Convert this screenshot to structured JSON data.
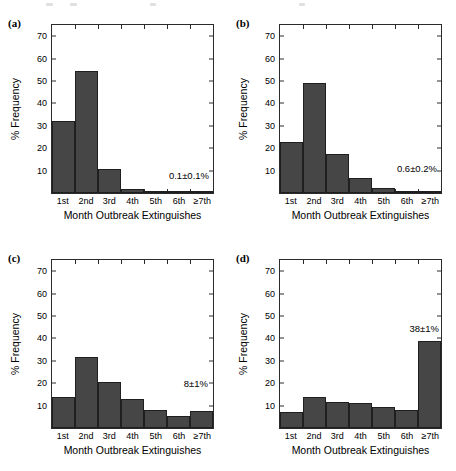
{
  "figure": {
    "panels": [
      {
        "key": "a",
        "label": "(a)",
        "week_note": "Week=1",
        "series_note": "0.1±0.1%",
        "note_position": "inside-bottom-right",
        "chart_data": {
          "type": "bar",
          "title": "",
          "xlabel": "Month Outbreak Extinguishes",
          "ylabel": "% Frequency",
          "categories": [
            "1st",
            "2nd",
            "3rd",
            "4th",
            "5th",
            "6th",
            "≥7th"
          ],
          "values": [
            32.3,
            54.5,
            10.7,
            1.8,
            0.4,
            0.1,
            0.1
          ],
          "ylim": [
            0,
            75
          ],
          "yticks": [
            10,
            20,
            30,
            40,
            50,
            60,
            70
          ],
          "grid": false,
          "legend": "none"
        }
      },
      {
        "key": "b",
        "label": "(b)",
        "week_note": "Week=2",
        "series_note": "0.6±0.2%",
        "note_position": "inside-bottom-right",
        "chart_data": {
          "type": "bar",
          "title": "",
          "xlabel": "Month Outbreak Extinguishes",
          "ylabel": "% Frequency",
          "categories": [
            "1st",
            "2nd",
            "3rd",
            "4th",
            "5th",
            "6th",
            "≥7th"
          ],
          "values": [
            22.8,
            49.3,
            17.5,
            6.8,
            2.4,
            0.6,
            0.6
          ],
          "ylim": [
            0,
            75
          ],
          "yticks": [
            10,
            20,
            30,
            40,
            50,
            60,
            70
          ],
          "grid": false,
          "legend": "none"
        }
      },
      {
        "key": "c",
        "label": "(c)",
        "week_note": "Week=4",
        "series_note": "8±1%",
        "note_position": "above-last-bar",
        "chart_data": {
          "type": "bar",
          "title": "",
          "xlabel": "Month Outbreak Extinguishes",
          "ylabel": "% Frequency",
          "categories": [
            "1st",
            "2nd",
            "3rd",
            "4th",
            "5th",
            "6th",
            "≥7th"
          ],
          "values": [
            14.0,
            31.6,
            20.4,
            12.8,
            8.0,
            5.2,
            7.8
          ],
          "ylim": [
            0,
            75
          ],
          "yticks": [
            10,
            20,
            30,
            40,
            50,
            60,
            70
          ],
          "grid": false,
          "legend": "none"
        }
      },
      {
        "key": "d",
        "label": "(d)",
        "week_note": "Week=8",
        "series_note": "38±1%",
        "note_position": "above-last-bar",
        "chart_data": {
          "type": "bar",
          "title": "",
          "xlabel": "Month Outbreak Extinguishes",
          "ylabel": "% Frequency",
          "categories": [
            "1st",
            "2nd",
            "3rd",
            "4th",
            "5th",
            "6th",
            "≥7th"
          ],
          "values": [
            7.0,
            14.0,
            11.7,
            11.0,
            9.3,
            8.2,
            38.8
          ],
          "ylim": [
            0,
            75
          ],
          "yticks": [
            10,
            20,
            30,
            40,
            50,
            60,
            70
          ],
          "grid": false,
          "legend": "none"
        }
      }
    ],
    "colors": {
      "bar_fill": "#464646",
      "bar_edge": "#1f1f1f",
      "axis": "#2b2b2b",
      "background": "#ffffff",
      "text": "#000000"
    }
  }
}
